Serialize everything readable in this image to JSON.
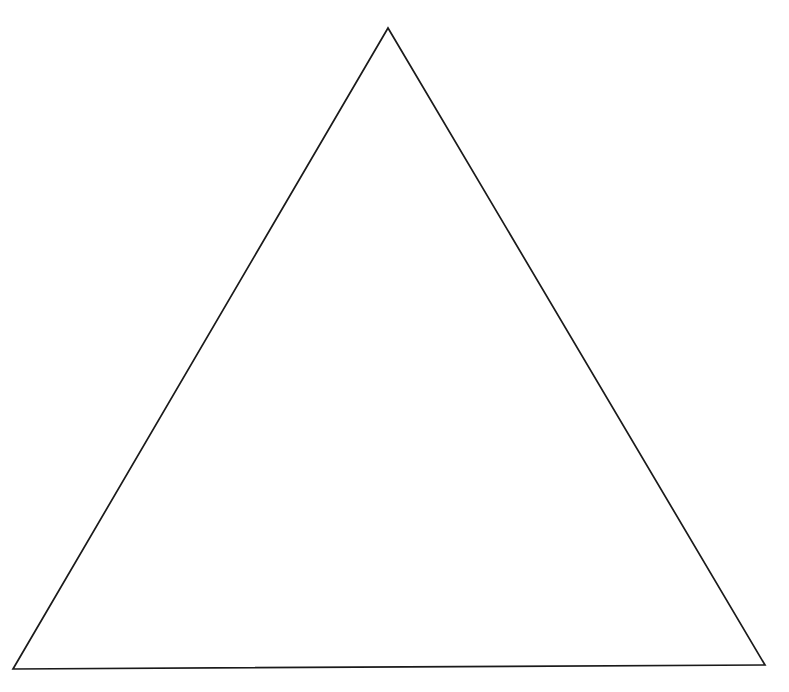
{
  "figure": {
    "background_color": "#ffffff",
    "canvas_width": 789,
    "canvas_height": 692,
    "shape_name": "triangle",
    "stroke_color": "#1a1a1a",
    "stroke_width": 1.7,
    "fill": "none",
    "vertices": {
      "apex": {
        "x": 388,
        "y": 28
      },
      "bottom_left": {
        "x": 13,
        "y": 669
      },
      "bottom_right": {
        "x": 765,
        "y": 665
      }
    },
    "polygon_points": "388,28 13,669 765,665"
  },
  "caption": {
    "clipped_text": "The triangle figure",
    "note": "cut off at top edge"
  }
}
